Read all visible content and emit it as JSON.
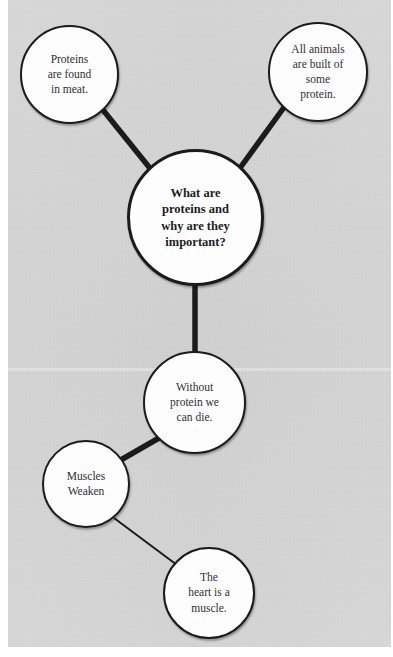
{
  "diagram": {
    "background_color": "#d5d5d5",
    "node_fill_color": "#fdfdfd",
    "node_stroke_color": "#1b1b1b",
    "edge_color": "#1b1b1b",
    "nodes": [
      {
        "id": "proteins-in-meat",
        "label": "Proteins\nare found\nin meat.",
        "bold": false,
        "cx": 69,
        "cy": 74,
        "r": 49
      },
      {
        "id": "all-animals-protein",
        "label": "All animals\nare built of\nsome\nprotein.",
        "bold": false,
        "cx": 318,
        "cy": 72,
        "r": 50
      },
      {
        "id": "central-question",
        "label": "What are\nproteins and\nwhy are they\nimportant?",
        "bold": true,
        "cx": 195,
        "cy": 217,
        "r": 68
      },
      {
        "id": "without-protein-die",
        "label": "Without\nprotein we\ncan die.",
        "bold": false,
        "cx": 194,
        "cy": 402,
        "r": 51
      },
      {
        "id": "muscles-weaken",
        "label": "Muscles\nWeaken",
        "bold": false,
        "cx": 86,
        "cy": 484,
        "r": 44
      },
      {
        "id": "heart-is-muscle",
        "label": "The\nheart is a\nmuscle.",
        "bold": false,
        "cx": 209,
        "cy": 593,
        "r": 46
      }
    ],
    "edges": [
      {
        "id": "edge-proteins-central",
        "from": "proteins-in-meat",
        "to": "central-question",
        "x1": 103,
        "y1": 110,
        "x2": 153,
        "y2": 172,
        "width": 5.5
      },
      {
        "id": "edge-animals-central",
        "from": "all-animals-protein",
        "to": "central-question",
        "x1": 285,
        "y1": 106,
        "x2": 240,
        "y2": 168,
        "width": 5.5
      },
      {
        "id": "edge-central-without",
        "from": "central-question",
        "to": "without-protein-die",
        "x1": 195,
        "y1": 285,
        "x2": 195,
        "y2": 352,
        "width": 5.5
      },
      {
        "id": "edge-without-muscles",
        "from": "without-protein-die",
        "to": "muscles-weaken",
        "x1": 159,
        "y1": 438,
        "x2": 119,
        "y2": 461,
        "width": 5.5
      },
      {
        "id": "edge-muscles-heart",
        "from": "muscles-weaken",
        "to": "heart-is-muscle",
        "x1": 114,
        "y1": 518,
        "x2": 181,
        "y2": 568,
        "width": 2
      }
    ]
  }
}
